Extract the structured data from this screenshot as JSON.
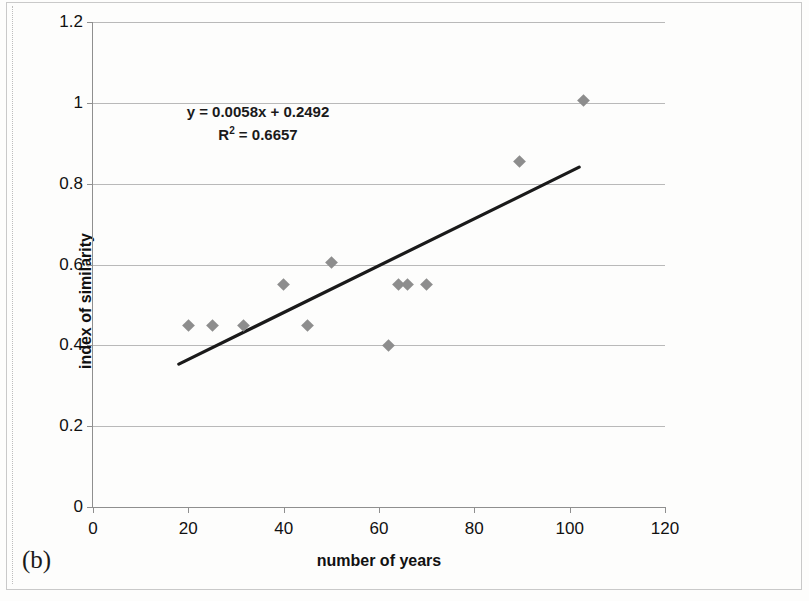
{
  "caption": "(b)",
  "annotation": {
    "equation": "y = 0.0058x + 0.2492",
    "r_squared_prefix": "R",
    "r_squared_exp": "2",
    "r_squared_value": " = 0.6657"
  },
  "colors": {
    "marker": "#8d8d8d",
    "trendline": "#1a1a1a",
    "gridline": "#b9b9b9",
    "axis": "#8f8f8f",
    "text": "#111111"
  },
  "chart_data": {
    "type": "scatter",
    "title": "",
    "xlabel": "number of years",
    "ylabel": "index of similarity",
    "xlim": [
      0,
      120
    ],
    "ylim": [
      0,
      1.2
    ],
    "xticks": [
      0,
      20,
      40,
      60,
      80,
      100,
      120
    ],
    "yticks": [
      0,
      0.2,
      0.4,
      0.6,
      0.8,
      1,
      1.2
    ],
    "xtick_labels": [
      "0",
      "20",
      "40",
      "60",
      "80",
      "100",
      "120"
    ],
    "ytick_labels": [
      "0",
      "0.2",
      "0.4",
      "0.6",
      "0.8",
      "1",
      "1.2"
    ],
    "grid": "horizontal",
    "legend": "none",
    "points": [
      {
        "x": 20,
        "y": 0.45
      },
      {
        "x": 25,
        "y": 0.45
      },
      {
        "x": 31.5,
        "y": 0.45
      },
      {
        "x": 40,
        "y": 0.55
      },
      {
        "x": 45,
        "y": 0.45
      },
      {
        "x": 50,
        "y": 0.605
      },
      {
        "x": 62,
        "y": 0.4
      },
      {
        "x": 64,
        "y": 0.55
      },
      {
        "x": 66,
        "y": 0.55
      },
      {
        "x": 70,
        "y": 0.55
      },
      {
        "x": 89.5,
        "y": 0.855
      },
      {
        "x": 103,
        "y": 1.005
      }
    ],
    "trendline": {
      "slope": 0.0058,
      "intercept": 0.2492,
      "x_start": 18,
      "x_end": 102,
      "y_start": 0.3536,
      "y_end": 0.8408
    }
  }
}
